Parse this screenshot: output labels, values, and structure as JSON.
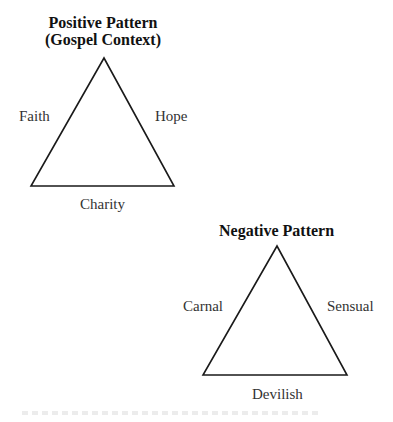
{
  "positive": {
    "title_line1": "Positive Pattern",
    "title_line2": "(Gospel Context)",
    "left": "Faith",
    "right": "Hope",
    "bottom": "Charity"
  },
  "negative": {
    "title": "Negative Pattern",
    "left": "Carnal",
    "right": "Sensual",
    "bottom": "Devilish"
  },
  "colors": {
    "stroke": "#1a1a1a",
    "text": "#333333"
  }
}
